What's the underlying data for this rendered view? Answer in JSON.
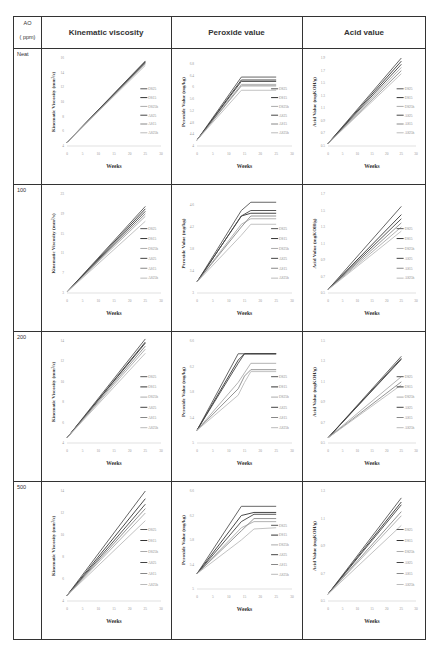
{
  "table": {
    "ao_header": [
      "AO",
      "( ppm)"
    ],
    "columns": [
      "Kinematic viscosity",
      "Peroxide value",
      "Acid value"
    ],
    "rows": [
      "Neat",
      "100",
      "200",
      "500"
    ]
  },
  "legend": [
    "OS25",
    "OS15",
    "OS25h",
    "AS25",
    "AS15",
    "AS25h"
  ],
  "series_colors": [
    "#555555",
    "#333333",
    "#aaaaaa",
    "#444444",
    "#888888",
    "#bbbbbb"
  ],
  "chart_data": [
    {
      "type": "line",
      "row": "Neat",
      "title": "Kinematic viscosity",
      "xlabel": "Weeks",
      "ylabel": "Kinematic Viscosity (mm²/s)",
      "x": [
        0,
        25
      ],
      "xticks": [
        0,
        5,
        10,
        15,
        20,
        25,
        30
      ],
      "yticks": [
        4,
        6,
        8,
        10,
        12,
        14,
        16
      ],
      "ylim": [
        4,
        16
      ],
      "series": [
        {
          "name": "OS25",
          "values": [
            4.5,
            15.6
          ]
        },
        {
          "name": "OS15",
          "values": [
            4.5,
            15.4
          ]
        },
        {
          "name": "OS25h",
          "values": [
            4.5,
            15.2
          ]
        },
        {
          "name": "AS25",
          "values": [
            4.5,
            15.5
          ]
        },
        {
          "name": "AS15",
          "values": [
            4.5,
            15.3
          ]
        },
        {
          "name": "AS25h",
          "values": [
            4.5,
            15.0
          ]
        }
      ]
    },
    {
      "type": "line",
      "row": "Neat",
      "title": "Peroxide value",
      "xlabel": "Weeks",
      "ylabel": "Peroxide Value (mg/kg)",
      "x": [
        0,
        14,
        25
      ],
      "xticks": [
        0,
        5,
        10,
        15,
        20,
        25,
        30
      ],
      "yticks": [
        4,
        4.2,
        4.4,
        4.6,
        4.8,
        5,
        5.2,
        5.4,
        5.6,
        5.8,
        6,
        6.2,
        6.4,
        6.6,
        6.8,
        7
      ],
      "ylim": [
        4,
        7
      ],
      "series": [
        {
          "name": "OS25",
          "values": [
            4.2,
            6.35,
            6.35
          ]
        },
        {
          "name": "OS15",
          "values": [
            4.2,
            6.25,
            6.25
          ]
        },
        {
          "name": "OS25h",
          "values": [
            4.2,
            6.1,
            6.1
          ]
        },
        {
          "name": "AS25",
          "values": [
            4.2,
            6.2,
            6.2
          ]
        },
        {
          "name": "AS15",
          "values": [
            4.2,
            6.05,
            6.05
          ]
        },
        {
          "name": "AS25h",
          "values": [
            4.2,
            5.9,
            5.9
          ]
        }
      ]
    },
    {
      "type": "line",
      "row": "Neat",
      "title": "Acid value",
      "xlabel": "Weeks",
      "ylabel": "Acid Value (mgKOH/g)",
      "x": [
        0,
        25
      ],
      "xticks": [
        0,
        5,
        10,
        15,
        20,
        25,
        30
      ],
      "yticks": [
        0.5,
        0.7,
        0.9,
        1.1,
        1.3,
        1.5,
        1.7,
        1.9
      ],
      "ylim": [
        0.5,
        1.9
      ],
      "series": [
        {
          "name": "OS25",
          "values": [
            0.54,
            1.9
          ]
        },
        {
          "name": "OS15",
          "values": [
            0.54,
            1.85
          ]
        },
        {
          "name": "OS25h",
          "values": [
            0.54,
            1.75
          ]
        },
        {
          "name": "AS25",
          "values": [
            0.54,
            1.8
          ]
        },
        {
          "name": "AS15",
          "values": [
            0.54,
            1.7
          ]
        },
        {
          "name": "AS25h",
          "values": [
            0.54,
            1.65
          ]
        }
      ]
    },
    {
      "type": "line",
      "row": "100",
      "title": "Kinematic viscosity",
      "xlabel": "Weeks",
      "ylabel": "Kinematic Viscosity (mm²/s)",
      "x": [
        0,
        25
      ],
      "xticks": [
        0,
        5,
        10,
        15,
        20,
        25,
        30
      ],
      "yticks": [
        3,
        7,
        11,
        15,
        19,
        23
      ],
      "ylim": [
        3,
        23
      ],
      "series": [
        {
          "name": "OS25",
          "values": [
            3.2,
            20.5
          ]
        },
        {
          "name": "OS15",
          "values": [
            3.2,
            20
          ]
        },
        {
          "name": "OS25h",
          "values": [
            3.2,
            18.5
          ]
        },
        {
          "name": "AS25",
          "values": [
            3.2,
            19.5
          ]
        },
        {
          "name": "AS15",
          "values": [
            3.2,
            19
          ]
        },
        {
          "name": "AS25h",
          "values": [
            3.2,
            17.5
          ]
        }
      ]
    },
    {
      "type": "line",
      "row": "100",
      "title": "Peroxide value",
      "xlabel": "Weeks",
      "ylabel": "Peroxide Value (mg/kg)",
      "x": [
        0,
        14,
        17,
        25
      ],
      "xticks": [
        0,
        5,
        10,
        15,
        20,
        25,
        30
      ],
      "yticks": [
        3,
        3.2,
        3.4,
        3.6,
        3.8,
        4,
        4.2,
        4.4,
        4.6,
        4.8
      ],
      "ylim": [
        3,
        4.8
      ],
      "series": [
        {
          "name": "OS25",
          "values": [
            3.2,
            4.5,
            4.65,
            4.65
          ]
        },
        {
          "name": "OS15",
          "values": [
            3.2,
            4.4,
            4.45,
            4.45
          ]
        },
        {
          "name": "OS25h",
          "values": [
            3.2,
            4.25,
            4.35,
            4.35
          ]
        },
        {
          "name": "AS25",
          "values": [
            3.2,
            4.4,
            4.5,
            4.5
          ]
        },
        {
          "name": "AS15",
          "values": [
            3.2,
            4.2,
            4.4,
            4.4
          ]
        },
        {
          "name": "AS25h",
          "values": [
            3.2,
            4.05,
            4.25,
            4.25
          ]
        }
      ]
    },
    {
      "type": "line",
      "row": "100",
      "title": "Acid value",
      "xlabel": "Weeks",
      "ylabel": "Acid Value (mgKOH/g)",
      "x": [
        0,
        25
      ],
      "xticks": [
        0,
        5,
        10,
        15,
        20,
        25,
        30
      ],
      "yticks": [
        0.5,
        0.7,
        0.9,
        1.1,
        1.3,
        1.5,
        1.7
      ],
      "ylim": [
        0.5,
        1.7
      ],
      "series": [
        {
          "name": "OS25",
          "values": [
            0.54,
            1.55
          ]
        },
        {
          "name": "OS15",
          "values": [
            0.54,
            1.45
          ]
        },
        {
          "name": "OS25h",
          "values": [
            0.54,
            1.3
          ]
        },
        {
          "name": "AS25",
          "values": [
            0.54,
            1.4
          ]
        },
        {
          "name": "AS15",
          "values": [
            0.54,
            1.35
          ]
        },
        {
          "name": "AS25h",
          "values": [
            0.54,
            1.25
          ]
        }
      ]
    },
    {
      "type": "line",
      "row": "200",
      "title": "Kinematic viscosity",
      "xlabel": "Weeks",
      "ylabel": "Kinematic Viscosity (mm²/s)",
      "x": [
        0,
        25
      ],
      "xticks": [
        0,
        5,
        10,
        15,
        20,
        25,
        30
      ],
      "yticks": [
        4,
        6,
        8,
        10,
        12,
        14
      ],
      "ylim": [
        4,
        14
      ],
      "series": [
        {
          "name": "OS25",
          "values": [
            4.5,
            14.2
          ]
        },
        {
          "name": "OS15",
          "values": [
            4.5,
            13.8
          ]
        },
        {
          "name": "OS25h",
          "values": [
            4.5,
            13.2
          ]
        },
        {
          "name": "AS25",
          "values": [
            4.5,
            13.9
          ]
        },
        {
          "name": "AS15",
          "values": [
            4.5,
            13.5
          ]
        },
        {
          "name": "AS25h",
          "values": [
            4.5,
            12.8
          ]
        }
      ]
    },
    {
      "type": "line",
      "row": "200",
      "title": "Peroxide value",
      "xlabel": "Weeks",
      "ylabel": "Peroxide Value (mg/kg)",
      "x": [
        0,
        13,
        15,
        17,
        25
      ],
      "xticks": [
        0,
        5,
        10,
        15,
        20,
        25,
        30
      ],
      "yticks": [
        5,
        5.2,
        5.4,
        5.6,
        5.8,
        6,
        6.2,
        6.4,
        6.6
      ],
      "ylim": [
        5,
        6.6
      ],
      "series": [
        {
          "name": "OS25",
          "values": [
            5.2,
            6.4,
            6.4,
            6.4,
            6.4
          ]
        },
        {
          "name": "OS15",
          "values": [
            5.2,
            6.3,
            6.4,
            6.4,
            6.4
          ]
        },
        {
          "name": "OS25h",
          "values": [
            5.2,
            5.95,
            6.1,
            6.25,
            6.25
          ]
        },
        {
          "name": "AS25",
          "values": [
            5.2,
            6.25,
            6.4,
            6.4,
            6.4
          ]
        },
        {
          "name": "AS15",
          "values": [
            5.2,
            5.85,
            6.05,
            6.15,
            6.15
          ]
        },
        {
          "name": "AS25h",
          "values": [
            5.2,
            5.75,
            5.95,
            6.12,
            6.12
          ]
        }
      ]
    },
    {
      "type": "line",
      "row": "200",
      "title": "Acid value",
      "xlabel": "Weeks",
      "ylabel": "Acid Value (mgKOH/g)",
      "x": [
        0,
        25
      ],
      "xticks": [
        0,
        5,
        10,
        15,
        20,
        25,
        30
      ],
      "yticks": [
        0.5,
        0.7,
        0.9,
        1.1,
        1.3,
        1.5
      ],
      "ylim": [
        0.5,
        1.5
      ],
      "series": [
        {
          "name": "OS25",
          "values": [
            0.55,
            1.35
          ]
        },
        {
          "name": "OS15",
          "values": [
            0.55,
            1.33
          ]
        },
        {
          "name": "OS25h",
          "values": [
            0.55,
            1.15
          ]
        },
        {
          "name": "AS25",
          "values": [
            0.55,
            1.32
          ]
        },
        {
          "name": "AS15",
          "values": [
            0.55,
            1.1
          ]
        },
        {
          "name": "AS25h",
          "values": [
            0.55,
            1.07
          ]
        }
      ]
    },
    {
      "type": "line",
      "row": "500",
      "title": "Kinematic viscosity",
      "xlabel": "Weeks",
      "ylabel": "Kinematic Viscosity (mm²/s)",
      "x": [
        0,
        25
      ],
      "xticks": [
        0,
        5,
        10,
        15,
        20,
        25,
        30
      ],
      "yticks": [
        4,
        6,
        8,
        10,
        12,
        14
      ],
      "ylim": [
        4,
        14
      ],
      "series": [
        {
          "name": "OS25",
          "values": [
            4.5,
            14
          ]
        },
        {
          "name": "OS15",
          "values": [
            4.5,
            13.3
          ]
        },
        {
          "name": "OS25h",
          "values": [
            4.5,
            12
          ]
        },
        {
          "name": "AS25",
          "values": [
            4.5,
            12.8
          ]
        },
        {
          "name": "AS15",
          "values": [
            4.5,
            12.4
          ]
        },
        {
          "name": "AS25h",
          "values": [
            4.5,
            11.3
          ]
        }
      ]
    },
    {
      "type": "line",
      "row": "500",
      "title": "Peroxide value",
      "xlabel": "Weeks",
      "ylabel": "Peroxide Value (mg/kg)",
      "x": [
        0,
        14,
        18,
        25
      ],
      "xticks": [
        0,
        5,
        10,
        15,
        20,
        25,
        30
      ],
      "yticks": [
        5,
        5.2,
        5.4,
        5.6,
        5.8,
        6,
        6.2,
        6.4,
        6.6
      ],
      "ylim": [
        5,
        6.6
      ],
      "series": [
        {
          "name": "OS25",
          "values": [
            5.25,
            6.35,
            6.35,
            6.35
          ]
        },
        {
          "name": "OS15",
          "values": [
            5.25,
            6.2,
            6.25,
            6.25
          ]
        },
        {
          "name": "OS25h",
          "values": [
            5.25,
            6.0,
            6.1,
            6.1
          ]
        },
        {
          "name": "AS25",
          "values": [
            5.25,
            6.1,
            6.22,
            6.22
          ]
        },
        {
          "name": "AS15",
          "values": [
            5.25,
            5.95,
            6.15,
            6.15
          ]
        },
        {
          "name": "AS25h",
          "values": [
            5.25,
            5.8,
            5.98,
            6.0
          ]
        }
      ]
    },
    {
      "type": "line",
      "row": "500",
      "title": "Acid value",
      "xlabel": "Weeks",
      "ylabel": "Acid Value (mgKOH/g)",
      "x": [
        0,
        25
      ],
      "xticks": [
        0,
        5,
        10,
        15,
        20,
        25,
        30
      ],
      "yticks": [
        0.5,
        0.7,
        0.9,
        1.1,
        1.3
      ],
      "ylim": [
        0.5,
        1.3
      ],
      "series": [
        {
          "name": "OS25",
          "values": [
            0.55,
            1.25
          ]
        },
        {
          "name": "OS15",
          "values": [
            0.55,
            1.22
          ]
        },
        {
          "name": "OS25h",
          "values": [
            0.55,
            1.12
          ]
        },
        {
          "name": "AS25",
          "values": [
            0.55,
            1.2
          ]
        },
        {
          "name": "AS15",
          "values": [
            0.55,
            1.15
          ]
        },
        {
          "name": "AS25h",
          "values": [
            0.55,
            1.05
          ]
        }
      ]
    }
  ]
}
